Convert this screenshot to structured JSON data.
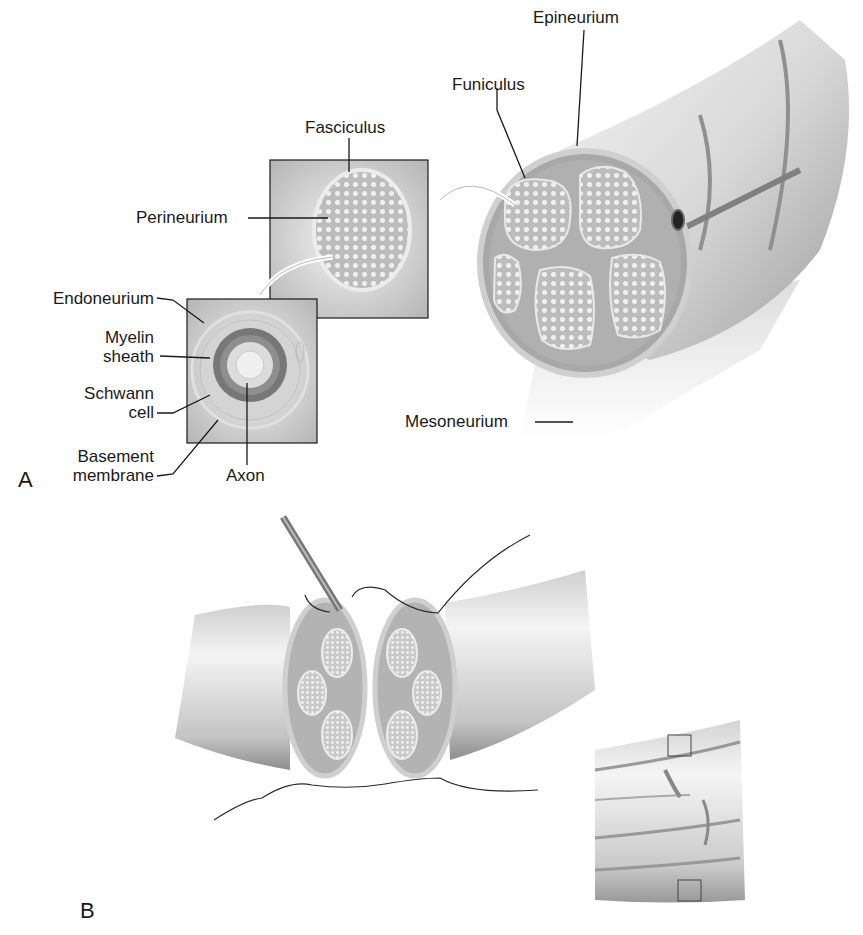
{
  "figure": {
    "panels": [
      {
        "id": "A",
        "label": "A"
      },
      {
        "id": "B",
        "label": "B"
      }
    ],
    "labels": {
      "fasciculus": "Fasciculus",
      "perineurium": "Perineurium",
      "funiculus": "Funiculus",
      "epineurium": "Epineurium",
      "endoneurium": "Endoneurium",
      "myelin_1": "Myelin",
      "myelin_2": "sheath",
      "schwann_1": "Schwann",
      "schwann_2": "cell",
      "basement_1": "Basement",
      "basement_2": "membrane",
      "axon": "Axon",
      "mesoneurium": "Mesoneurium"
    },
    "colors": {
      "line": "#1a1a1a",
      "nerve_light": "#e6e6e6",
      "nerve_mid": "#b8b8b8",
      "nerve_dark": "#8a8a8a",
      "myelin": "#6e6e6e"
    }
  }
}
